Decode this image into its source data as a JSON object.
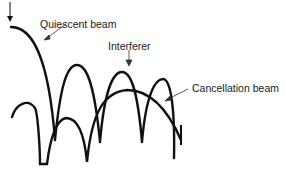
{
  "diagram": {
    "labels": {
      "quiescent": "Quiescent beam",
      "interferer": "Interferer",
      "cancellation": "Cancellation beam"
    },
    "colors": {
      "stroke": "#111111",
      "background": "#ffffff"
    }
  }
}
